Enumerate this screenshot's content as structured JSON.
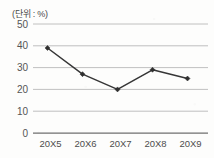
{
  "chart_data": {
    "type": "line",
    "title": "",
    "unit_label": "(단위 : %)",
    "xlabel": "",
    "ylabel": "",
    "categories": [
      "20X5",
      "20X6",
      "20X7",
      "20X8",
      "20X9"
    ],
    "values": [
      39,
      27,
      20,
      29,
      25
    ],
    "series": [
      {
        "name": "",
        "values": [
          39,
          27,
          20,
          29,
          25
        ]
      }
    ],
    "ylim": [
      0,
      50
    ],
    "yticks": [
      0,
      10,
      20,
      30,
      40,
      50
    ],
    "ytick_labels": [
      "0",
      "10",
      "20",
      "30",
      "40",
      "50"
    ],
    "grid": true,
    "grid_axis": "y",
    "legend": false,
    "legend_position": "none",
    "marker": "diamond",
    "line_color": "#363636",
    "marker_color": "#2f2f2f",
    "grid_color": "#b9b9b9",
    "axis_color": "#6f6f6f",
    "background_color": "#fdfdfc"
  }
}
